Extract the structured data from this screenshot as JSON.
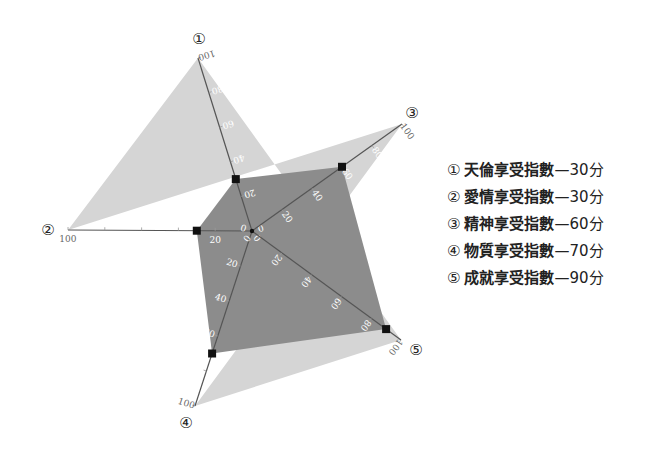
{
  "chart_data": {
    "type": "radar",
    "title": "",
    "categories": [
      "天倫享受指數",
      "愛情享受指數",
      "精神享受指數",
      "物質享受指數",
      "成就享受指數"
    ],
    "axis_markers": [
      "①",
      "②",
      "③",
      "④",
      "⑤"
    ],
    "values": [
      30,
      30,
      60,
      70,
      90
    ],
    "unit": "分",
    "range": [
      0,
      100
    ],
    "ticks": [
      0,
      20,
      40,
      60,
      80,
      100
    ],
    "legend_position": "right",
    "colors": {
      "outer": "#d5d5d5",
      "inner": "#8c8c8c",
      "axis": "#555555",
      "marker": "#111111"
    }
  },
  "legend": [
    {
      "num": "①",
      "label": "天倫享受指數",
      "score": "—30分"
    },
    {
      "num": "②",
      "label": "愛情享受指數",
      "score": "—30分"
    },
    {
      "num": "③",
      "label": "精神享受指數",
      "score": "—60分"
    },
    {
      "num": "④",
      "label": "物質享受指數",
      "score": "—70分"
    },
    {
      "num": "⑤",
      "label": "成就享受指數",
      "score": "—90分"
    }
  ]
}
